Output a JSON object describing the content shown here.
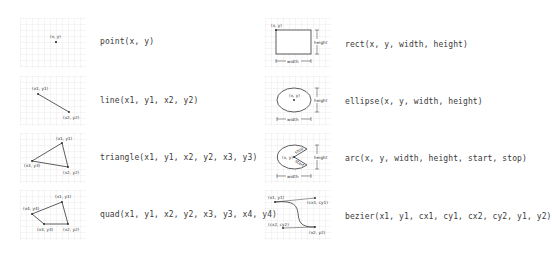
{
  "functions": [
    {
      "id": "point",
      "signature": "point(x,  y)",
      "annotations": [
        "(x, y)"
      ]
    },
    {
      "id": "line",
      "signature": "line(x1,  y1,  x2,  y2)",
      "annotations": [
        "(x1, y1)",
        "(x2, y2)"
      ]
    },
    {
      "id": "triangle",
      "signature": "triangle(x1,  y1,  x2,  y2,  x3,  y3)",
      "annotations": [
        "(x1, y1)",
        "(x2, y2)",
        "(x3, y3)"
      ]
    },
    {
      "id": "quad",
      "signature": "quad(x1,  y1,  x2,  y2,  x3,  y3,  x4,  y4)",
      "annotations": [
        "(x1, y1)",
        "(x2, y2)",
        "(x3, y3)",
        "(x4, y4)"
      ]
    },
    {
      "id": "rect",
      "signature": "rect(x,  y,  width,  height)",
      "annotations": [
        "(x, y)",
        "width",
        "height"
      ]
    },
    {
      "id": "ellipse",
      "signature": "ellipse(x,  y,  width,  height)",
      "annotations": [
        "(x, y)",
        "width",
        "height"
      ]
    },
    {
      "id": "arc",
      "signature": "arc(x,  y,  width,  height,  start,  stop)",
      "annotations": [
        "(x, y)",
        "width",
        "height",
        "start",
        "stop"
      ]
    },
    {
      "id": "bezier",
      "signature": "bezier(x1,  y1,  cx1,  cy1,  cx2,  cy2,  y1,  y2)",
      "annotations": [
        "(x1, y1)",
        "(cx1, cy1)",
        "(cx2, cy2)",
        "(x2, y2)"
      ]
    }
  ]
}
